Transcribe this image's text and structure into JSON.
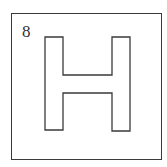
{
  "figure": {
    "number_label": "8",
    "shape": "H-shape outline",
    "stroke_color": "#3a3a3a",
    "background_color": "#ffffff"
  }
}
